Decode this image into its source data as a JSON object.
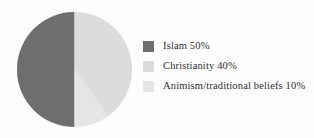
{
  "figure": {
    "background_color": "#fdfdfd",
    "text_color": "#2e2e2e"
  },
  "chart_data": {
    "type": "pie",
    "title": "",
    "subtitle": "",
    "xlabel": "",
    "ylabel": "",
    "grid": false,
    "legend_position": "right",
    "start_angle_deg": 90,
    "direction": "clockwise",
    "categories": [
      "Islam",
      "Christianity",
      "Animism/traditional beliefs"
    ],
    "values": [
      50,
      40,
      10
    ],
    "unit": "%",
    "colors": [
      "#6e6e6e",
      "#dcdcdc",
      "#e5e5e5"
    ],
    "slices": [
      {
        "label": "Islam",
        "value": 50,
        "value_text": "50%",
        "color": "#6e6e6e",
        "legend_text": "Islam 50%",
        "start_angle_deg": 90,
        "end_angle_deg": 270
      },
      {
        "label": "Christianity",
        "value": 40,
        "value_text": "40%",
        "color": "#dcdcdc",
        "legend_text": "Christianity 40%",
        "start_angle_deg": 270,
        "end_angle_deg": 414
      },
      {
        "label": "Animism/traditional beliefs",
        "value": 10,
        "value_text": "10%",
        "color": "#e5e5e5",
        "legend_text": "Animism/traditional beliefs 10%",
        "start_angle_deg": 414,
        "end_angle_deg": 450
      }
    ]
  },
  "legend": {
    "items": [
      {
        "label": "Islam 50%",
        "color": "#6e6e6e"
      },
      {
        "label": "Christianity 40%",
        "color": "#dcdcdc"
      },
      {
        "label": "Animism/traditional beliefs 10%",
        "color": "#e5e5e5"
      }
    ]
  }
}
